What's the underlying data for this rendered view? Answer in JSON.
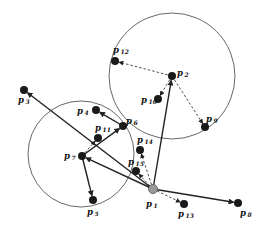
{
  "diagram": {
    "colors": {
      "node": "#1a1a1a",
      "root_node": "#9a9a9a",
      "edge": "#222222",
      "circle": "#555555",
      "background": "#ffffff"
    },
    "circles": [
      {
        "id": "circle-right",
        "cx": 172,
        "cy": 76,
        "r": 63
      },
      {
        "id": "circle-left",
        "cx": 81,
        "cy": 154,
        "r": 53
      }
    ],
    "nodes": [
      {
        "id": "p1",
        "label": "p",
        "sub": "1",
        "x": 153,
        "y": 189,
        "root": true,
        "lx": 146,
        "ly": 207
      },
      {
        "id": "p2",
        "label": "p",
        "sub": "2",
        "x": 172,
        "y": 76,
        "lx": 177,
        "ly": 76
      },
      {
        "id": "p3",
        "label": "p",
        "sub": "3",
        "x": 24,
        "y": 90,
        "lx": 18,
        "ly": 103
      },
      {
        "id": "p4",
        "label": "p",
        "sub": "4",
        "x": 96,
        "y": 110,
        "lx": 77,
        "ly": 114
      },
      {
        "id": "p5",
        "label": "p",
        "sub": "5",
        "x": 93,
        "y": 200,
        "lx": 87,
        "ly": 215
      },
      {
        "id": "p6",
        "label": "p",
        "sub": "6",
        "x": 123,
        "y": 126,
        "lx": 126,
        "ly": 124
      },
      {
        "id": "p7",
        "label": "p",
        "sub": "7",
        "x": 82,
        "y": 156,
        "lx": 64,
        "ly": 159
      },
      {
        "id": "p8",
        "label": "p",
        "sub": "8",
        "x": 238,
        "y": 203,
        "lx": 240,
        "ly": 216
      },
      {
        "id": "p9",
        "label": "p",
        "sub": "9",
        "x": 205,
        "y": 127,
        "lx": 206,
        "ly": 122
      },
      {
        "id": "p10",
        "label": "p",
        "sub": "10",
        "x": 158,
        "y": 99,
        "lx": 141,
        "ly": 103
      },
      {
        "id": "p11",
        "label": "p",
        "sub": "11",
        "x": 98,
        "y": 138,
        "lx": 95,
        "ly": 131
      },
      {
        "id": "p12",
        "label": "p",
        "sub": "12",
        "x": 115,
        "y": 61,
        "lx": 113,
        "ly": 53
      },
      {
        "id": "p13",
        "label": "p",
        "sub": "13",
        "x": 184,
        "y": 204,
        "lx": 178,
        "ly": 217
      },
      {
        "id": "p14",
        "label": "p",
        "sub": "14",
        "x": 140,
        "y": 150,
        "lx": 137,
        "ly": 143
      },
      {
        "id": "p15",
        "label": "p",
        "sub": "15",
        "x": 136,
        "y": 171,
        "lx": 128,
        "ly": 165
      }
    ],
    "solid_edges": [
      {
        "from": "p1",
        "to": "p2"
      },
      {
        "from": "p1",
        "to": "p3"
      },
      {
        "from": "p1",
        "to": "p7"
      },
      {
        "from": "p1",
        "to": "p8"
      },
      {
        "from": "p7",
        "to": "p6"
      },
      {
        "from": "p7",
        "to": "p5"
      },
      {
        "from": "p6",
        "to": "p4"
      }
    ],
    "dashed_edges": [
      {
        "from": "p2",
        "to": "p12"
      },
      {
        "from": "p2",
        "to": "p10"
      },
      {
        "from": "p2",
        "to": "p9"
      },
      {
        "from": "p1",
        "to": "p13"
      },
      {
        "from": "p1",
        "to": "p14"
      },
      {
        "from": "p1",
        "to": "p15"
      },
      {
        "from": "p7",
        "to": "p11"
      }
    ]
  }
}
